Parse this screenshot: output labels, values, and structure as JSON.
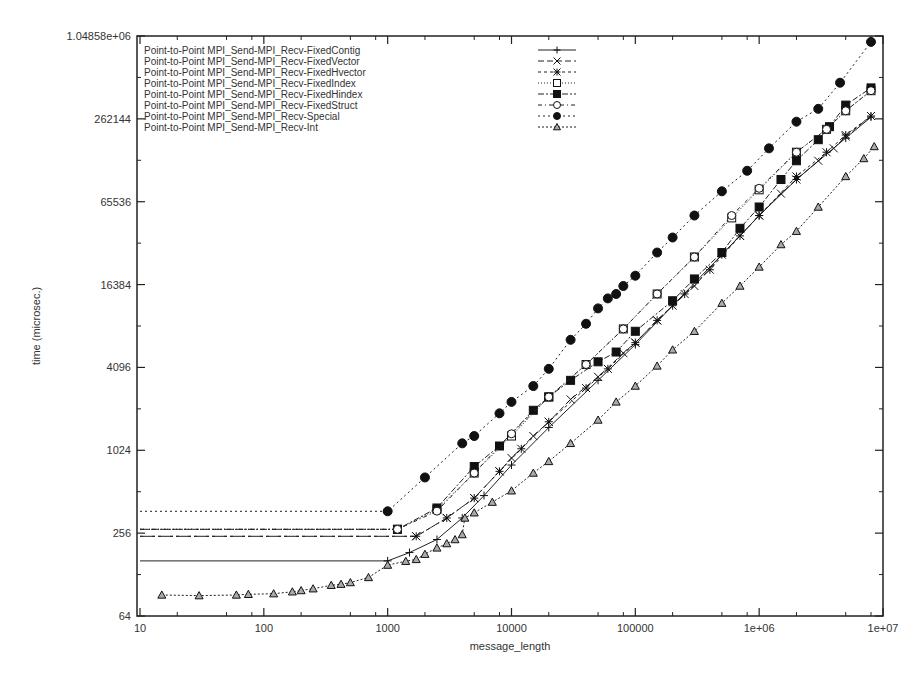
{
  "chart_data": {
    "type": "line",
    "title": "",
    "xlabel": "message_length",
    "ylabel": "time (microsec.)",
    "xscale": "log10",
    "yscale": "log2",
    "xlim": [
      10,
      10000000
    ],
    "ylim": [
      64,
      1048576
    ],
    "xticks": [
      "10",
      "100",
      "1000",
      "10000",
      "100000",
      "1e+06",
      "1e+07"
    ],
    "xtick_values": [
      10,
      100,
      1000,
      10000,
      100000,
      1000000,
      10000000
    ],
    "yticks": [
      "64",
      "256",
      "1024",
      "4096",
      "16384",
      "65536",
      "262144",
      "1.04858e+06"
    ],
    "ytick_values": [
      64,
      256,
      1024,
      4096,
      16384,
      65536,
      262144,
      1048576
    ],
    "legend_position": "top-left inside",
    "grid": false,
    "series": [
      {
        "name": "Point-to-Point MPI_Send-MPI_Recv-FixedContig",
        "marker": "plus",
        "dash": "",
        "points": [
          [
            10,
            161
          ],
          [
            1000,
            161
          ],
          [
            1500,
            185
          ],
          [
            2500,
            230
          ],
          [
            4000,
            330
          ],
          [
            6000,
            480
          ],
          [
            10000,
            800
          ],
          [
            20000,
            1500
          ],
          [
            50000,
            3300
          ],
          [
            100000,
            6000
          ],
          [
            200000,
            11500
          ],
          [
            500000,
            27000
          ],
          [
            1000000,
            52000
          ],
          [
            2000000,
            95000
          ],
          [
            5000000,
            190000
          ],
          [
            8000000,
            270000
          ]
        ]
      },
      {
        "name": "Point-to-Point MPI_Send-MPI_Recv-FixedVector",
        "marker": "x",
        "dash": "6,3",
        "points": [
          [
            10,
            243
          ],
          [
            1700,
            243
          ],
          [
            3000,
            330
          ],
          [
            5000,
            460
          ],
          [
            8000,
            720
          ],
          [
            10000,
            900
          ],
          [
            15000,
            1300
          ],
          [
            20000,
            1650
          ],
          [
            30000,
            2400
          ],
          [
            50000,
            3500
          ],
          [
            80000,
            5200
          ],
          [
            100000,
            6200
          ],
          [
            150000,
            9000
          ],
          [
            200000,
            11500
          ],
          [
            300000,
            16000
          ],
          [
            500000,
            27000
          ],
          [
            700000,
            37000
          ],
          [
            1000000,
            52000
          ],
          [
            1500000,
            75000
          ],
          [
            2000000,
            95000
          ],
          [
            3000000,
            130000
          ],
          [
            4000000,
            160000
          ],
          [
            5000000,
            195000
          ],
          [
            8000000,
            275000
          ]
        ]
      },
      {
        "name": "Point-to-Point MPI_Send-MPI_Recv-FixedHvector",
        "marker": "asterisk",
        "dash": "3,3",
        "points": [
          [
            10,
            243
          ],
          [
            1700,
            243
          ],
          [
            3000,
            330
          ],
          [
            5000,
            460
          ],
          [
            8000,
            720
          ],
          [
            12000,
            1050
          ],
          [
            20000,
            1650
          ],
          [
            40000,
            2900
          ],
          [
            60000,
            4000
          ],
          [
            100000,
            6200
          ],
          [
            150000,
            9000
          ],
          [
            250000,
            14000
          ],
          [
            400000,
            21000
          ],
          [
            700000,
            37000
          ],
          [
            1000000,
            52000
          ],
          [
            2000000,
            100000
          ],
          [
            3500000,
            150000
          ],
          [
            5000000,
            200000
          ],
          [
            8000000,
            275000
          ]
        ]
      },
      {
        "name": "Point-to-Point MPI_Send-MPI_Recv-FixedIndex",
        "marker": "square-open",
        "dash": "1,2",
        "points": [
          [
            10,
            273
          ],
          [
            1200,
            273
          ],
          [
            2500,
            380
          ],
          [
            5000,
            700
          ],
          [
            10000,
            1300
          ],
          [
            20000,
            2500
          ],
          [
            40000,
            4300
          ],
          [
            80000,
            7800
          ],
          [
            150000,
            14000
          ],
          [
            300000,
            26000
          ],
          [
            600000,
            50000
          ],
          [
            1000000,
            80000
          ],
          [
            2000000,
            150000
          ],
          [
            3500000,
            220000
          ],
          [
            5000000,
            300000
          ],
          [
            8000000,
            420000
          ]
        ]
      },
      {
        "name": "Point-to-Point MPI_Send-MPI_Recv-FixedHindex",
        "marker": "square-filled",
        "dash": "6,2,2,2",
        "points": [
          [
            10,
            273
          ],
          [
            1200,
            273
          ],
          [
            2500,
            390
          ],
          [
            5000,
            780
          ],
          [
            8000,
            1100
          ],
          [
            15000,
            2000
          ],
          [
            20000,
            2500
          ],
          [
            30000,
            3300
          ],
          [
            50000,
            4500
          ],
          [
            70000,
            5300
          ],
          [
            100000,
            7500
          ],
          [
            200000,
            12500
          ],
          [
            300000,
            18000
          ],
          [
            500000,
            28000
          ],
          [
            700000,
            42000
          ],
          [
            1000000,
            60000
          ],
          [
            1500000,
            95000
          ],
          [
            2000000,
            130000
          ],
          [
            3000000,
            185000
          ],
          [
            3700000,
            230000
          ],
          [
            5000000,
            330000
          ],
          [
            8000000,
            440000
          ]
        ]
      },
      {
        "name": "Point-to-Point MPI_Send-MPI_Recv-FixedStruct",
        "marker": "circle-open",
        "dash": "4,3,1,3",
        "points": [
          [
            10,
            273
          ],
          [
            1200,
            273
          ],
          [
            2500,
            370
          ],
          [
            5000,
            700
          ],
          [
            10000,
            1350
          ],
          [
            20000,
            2500
          ],
          [
            40000,
            4300
          ],
          [
            80000,
            7800
          ],
          [
            150000,
            14000
          ],
          [
            300000,
            26000
          ],
          [
            600000,
            52000
          ],
          [
            1000000,
            82000
          ],
          [
            2000000,
            150000
          ],
          [
            3500000,
            220000
          ],
          [
            5000000,
            300000
          ],
          [
            8000000,
            420000
          ]
        ]
      },
      {
        "name": "Point-to-Point MPI_Send-MPI_Recv-Special",
        "marker": "circle-filled",
        "dash": "2,3",
        "points": [
          [
            10,
            369
          ],
          [
            1000,
            369
          ],
          [
            2000,
            650
          ],
          [
            4000,
            1150
          ],
          [
            5000,
            1300
          ],
          [
            8000,
            1900
          ],
          [
            10000,
            2300
          ],
          [
            15000,
            3000
          ],
          [
            20000,
            4000
          ],
          [
            30000,
            6500
          ],
          [
            40000,
            8500
          ],
          [
            50000,
            11000
          ],
          [
            60000,
            13000
          ],
          [
            70000,
            14000
          ],
          [
            80000,
            16000
          ],
          [
            100000,
            19000
          ],
          [
            150000,
            28000
          ],
          [
            200000,
            36000
          ],
          [
            300000,
            52000
          ],
          [
            500000,
            78000
          ],
          [
            800000,
            110000
          ],
          [
            1200000,
            160000
          ],
          [
            2000000,
            250000
          ],
          [
            3000000,
            310000
          ],
          [
            4500000,
            480000
          ],
          [
            8000000,
            950000
          ]
        ]
      },
      {
        "name": "Point-to-Point MPI_Send-MPI_Recv-Int",
        "marker": "triangle",
        "dash": "2,2",
        "points": [
          [
            15,
            91
          ],
          [
            30,
            90
          ],
          [
            60,
            91
          ],
          [
            75,
            92
          ],
          [
            120,
            93
          ],
          [
            170,
            96
          ],
          [
            200,
            98
          ],
          [
            250,
            101
          ],
          [
            350,
            107
          ],
          [
            420,
            109
          ],
          [
            500,
            112
          ],
          [
            700,
            122
          ],
          [
            1000,
            150
          ],
          [
            1400,
            160
          ],
          [
            1700,
            165
          ],
          [
            2000,
            180
          ],
          [
            2500,
            200
          ],
          [
            3000,
            215
          ],
          [
            3500,
            230
          ],
          [
            4000,
            250
          ],
          [
            4200,
            330
          ],
          [
            5000,
            360
          ],
          [
            7000,
            430
          ],
          [
            10000,
            520
          ],
          [
            15000,
            700
          ],
          [
            20000,
            850
          ],
          [
            30000,
            1150
          ],
          [
            50000,
            1700
          ],
          [
            70000,
            2300
          ],
          [
            100000,
            3000
          ],
          [
            150000,
            4200
          ],
          [
            200000,
            5500
          ],
          [
            300000,
            7500
          ],
          [
            500000,
            12000
          ],
          [
            700000,
            16000
          ],
          [
            1000000,
            22000
          ],
          [
            1500000,
            32000
          ],
          [
            2000000,
            40000
          ],
          [
            3000000,
            60000
          ],
          [
            5000000,
            100000
          ],
          [
            7000000,
            135000
          ],
          [
            8500000,
            165000
          ]
        ]
      }
    ]
  }
}
